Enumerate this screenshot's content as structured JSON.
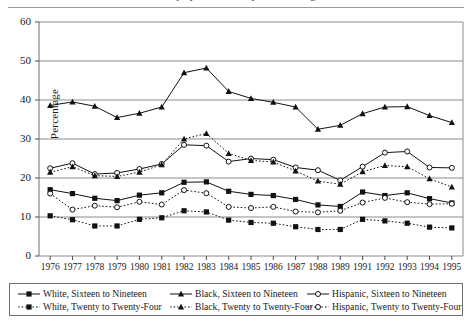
{
  "figure": {
    "title_clipped": "Unemployment Rates by Race and Age",
    "ylabel": "Percentage"
  },
  "axes": {
    "y_ticks": [
      "60",
      "50",
      "40",
      "30",
      "20",
      "10",
      "0"
    ],
    "x_ticks": [
      "1976",
      "1977",
      "1978",
      "1979",
      "1980",
      "1981",
      "1982",
      "1983",
      "1984",
      "1985",
      "1986",
      "1987",
      "1988",
      "1989",
      "1991",
      "1992",
      "1993",
      "1994",
      "1995"
    ]
  },
  "legend": {
    "items": [
      {
        "label": "White, Sixteen to Nineteen",
        "marker": "square-filled",
        "line": "solid"
      },
      {
        "label": "Black, Sixteen to Nineteen",
        "marker": "triangle-filled",
        "line": "solid"
      },
      {
        "label": "Hispanic, Sixteen to Nineteen",
        "marker": "circle-open",
        "line": "solid"
      },
      {
        "label": "White, Twenty to Twenty-Four",
        "marker": "square-filled",
        "line": "dotted"
      },
      {
        "label": "Black, Twenty to Twenty-Four",
        "marker": "triangle-filled",
        "line": "dotted"
      },
      {
        "label": "Hispanic, Twenty to Twenty-Four",
        "marker": "circle-open",
        "line": "dotted"
      }
    ]
  },
  "chart_data": {
    "type": "line",
    "title": "Unemployment Rates by Race and Age",
    "xlabel": "",
    "ylabel": "Percentage",
    "ylim": [
      0,
      60
    ],
    "ytick_step": 10,
    "grid": true,
    "legend_position": "bottom",
    "categories": [
      "1976",
      "1977",
      "1978",
      "1979",
      "1980",
      "1981",
      "1982",
      "1983",
      "1984",
      "1985",
      "1986",
      "1987",
      "1988",
      "1989",
      "1991",
      "1992",
      "1993",
      "1994",
      "1995"
    ],
    "series": [
      {
        "name": "White, Sixteen to Nineteen",
        "marker": "square-filled",
        "line": "solid",
        "values": [
          17.0,
          16.0,
          14.8,
          14.2,
          15.6,
          16.2,
          18.9,
          19.0,
          16.6,
          15.8,
          15.5,
          14.5,
          13.1,
          12.7,
          16.4,
          15.5,
          16.2,
          14.7,
          13.6
        ]
      },
      {
        "name": "Black, Sixteen to Nineteen",
        "marker": "triangle-filled",
        "line": "solid",
        "values": [
          38.6,
          39.5,
          38.4,
          35.5,
          36.6,
          38.2,
          47.0,
          48.2,
          42.2,
          40.4,
          39.4,
          38.2,
          32.5,
          33.5,
          36.5,
          38.2,
          38.3,
          36.0,
          34.2
        ]
      },
      {
        "name": "Hispanic, Sixteen to Nineteen",
        "marker": "circle-open",
        "line": "solid",
        "values": [
          22.5,
          23.8,
          21.0,
          21.3,
          22.3,
          23.6,
          28.5,
          28.3,
          24.2,
          25.0,
          24.7,
          22.7,
          22.0,
          19.4,
          22.9,
          26.5,
          26.8,
          22.7,
          22.6
        ]
      },
      {
        "name": "White, Twenty to Twenty-Four",
        "marker": "square-filled",
        "line": "dotted",
        "values": [
          10.3,
          9.3,
          7.7,
          7.7,
          9.4,
          9.8,
          11.6,
          11.3,
          9.2,
          8.6,
          8.4,
          7.5,
          6.8,
          6.8,
          9.4,
          9.0,
          8.4,
          7.4,
          7.2
        ]
      },
      {
        "name": "Black, Twenty to Twenty-Four",
        "marker": "triangle-filled",
        "line": "dotted",
        "values": [
          21.5,
          22.9,
          20.6,
          20.4,
          21.5,
          23.4,
          30.0,
          31.4,
          26.3,
          24.5,
          24.1,
          21.8,
          19.2,
          18.4,
          21.6,
          23.2,
          22.9,
          19.8,
          17.7
        ]
      },
      {
        "name": "Hispanic, Twenty to Twenty-Four",
        "marker": "circle-open",
        "line": "dotted",
        "values": [
          16.0,
          11.9,
          12.9,
          12.5,
          13.9,
          13.2,
          16.9,
          16.1,
          12.6,
          12.3,
          12.6,
          11.4,
          11.2,
          11.6,
          13.7,
          14.9,
          13.8,
          13.3,
          13.4
        ]
      }
    ]
  }
}
